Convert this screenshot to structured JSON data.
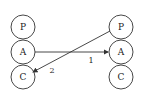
{
  "diagram": {
    "left_stack": {
      "nodes": [
        {
          "label": "P",
          "cx": 23,
          "cy": 27
        },
        {
          "label": "A",
          "cx": 23,
          "cy": 52
        },
        {
          "label": "C",
          "cx": 23,
          "cy": 76
        }
      ]
    },
    "right_stack": {
      "nodes": [
        {
          "label": "P",
          "cx": 121,
          "cy": 27
        },
        {
          "label": "A",
          "cx": 121,
          "cy": 52
        },
        {
          "label": "C",
          "cx": 121,
          "cy": 76
        }
      ]
    },
    "node_radius": 12,
    "edges": [
      {
        "label": "1",
        "from": "left.A",
        "to": "right.A"
      },
      {
        "label": "2",
        "from": "right.P",
        "to": "left.C"
      }
    ],
    "colors": {
      "stroke": "#333333",
      "background": "#ffffff"
    }
  }
}
